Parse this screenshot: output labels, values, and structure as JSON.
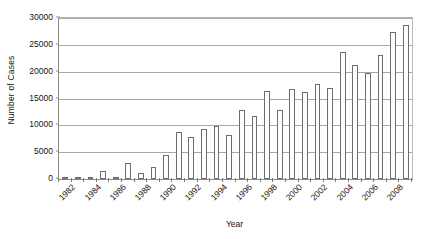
{
  "chart_data": {
    "type": "bar",
    "title": "",
    "xlabel": "Year",
    "ylabel": "Number of Cases",
    "ylim": [
      0,
      30000
    ],
    "ytick_values": [
      0,
      5000,
      10000,
      15000,
      20000,
      25000,
      30000
    ],
    "ytick_labels": [
      "0",
      "5000",
      "10000",
      "15000",
      "20000",
      "25000",
      "30000"
    ],
    "grid": true,
    "legend": "none",
    "xtick_labels": [
      "1982",
      "1984",
      "1986",
      "1988",
      "1990",
      "1992",
      "1994",
      "1996",
      "1998",
      "2000",
      "2002",
      "2004",
      "2006",
      "2008"
    ],
    "categories": [
      "1982",
      "1983",
      "1984",
      "1985",
      "1986",
      "1987",
      "1988",
      "1989",
      "1990",
      "1991",
      "1992",
      "1993",
      "1994",
      "1995",
      "1996",
      "1997",
      "1998",
      "1999",
      "2000",
      "2001",
      "2002",
      "2003",
      "2004",
      "2005",
      "2006",
      "2007",
      "2008",
      "2009"
    ],
    "values": [
      200,
      150,
      350,
      1500,
      250,
      2900,
      1100,
      2300,
      4500,
      8800,
      7900,
      9400,
      9900,
      8200,
      12900,
      11700,
      16400,
      12800,
      16800,
      16200,
      17700,
      16900,
      23700,
      21200,
      19800,
      23200,
      19900,
      19900
    ],
    "values_tail": [
      27400,
      28700
    ],
    "bar_style": {
      "fill": "#fdfdfd",
      "edge": "#6e6e6e"
    }
  }
}
